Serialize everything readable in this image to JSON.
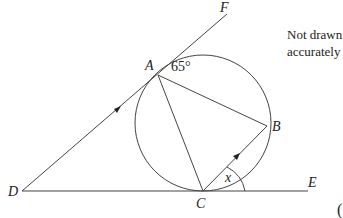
{
  "diagram": {
    "note_lines": [
      "Not drawn",
      "accurately"
    ],
    "points": {
      "A": {
        "label": "A",
        "x": 158,
        "y": 75
      },
      "B": {
        "label": "B",
        "x": 267,
        "y": 126
      },
      "C": {
        "label": "C",
        "x": 203,
        "y": 191
      },
      "D": {
        "label": "D",
        "x": 22,
        "y": 191
      },
      "E": {
        "label": "E",
        "x": 308,
        "y": 191
      },
      "F": {
        "label": "F",
        "x": 227,
        "y": 14
      }
    },
    "circle": {
      "cx": 203,
      "cy": 123,
      "r": 68
    },
    "angle_labels": {
      "FAB": "65°",
      "BCE": "x"
    },
    "parallel_marks": [
      "DA",
      "CB"
    ],
    "trailing_text": "("
  }
}
